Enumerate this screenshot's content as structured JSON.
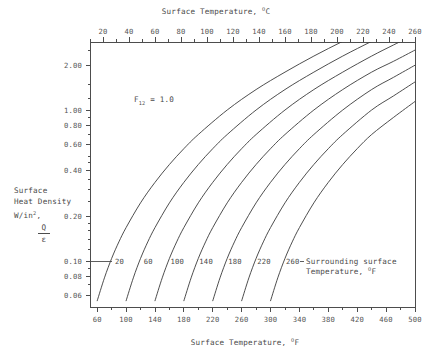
{
  "chart_data": {
    "type": "line",
    "title": "",
    "annotation": "F12 = 1.0",
    "annotation_base": "F",
    "annotation_sub": "12",
    "annotation_rest": " = 1.0",
    "top_axis": {
      "label_text": "Surface Temperature, ",
      "label_unit_sup": "O",
      "label_unit": "C",
      "ticks": [
        20,
        40,
        60,
        80,
        100,
        120,
        140,
        160,
        180,
        200,
        220,
        240,
        260
      ],
      "minor_step": 10,
      "range": [
        10,
        260
      ]
    },
    "bottom_axis": {
      "label_text": "Surface Temperature, ",
      "label_unit_sup": "O",
      "label_unit": "F",
      "ticks": [
        60,
        100,
        140,
        180,
        220,
        260,
        300,
        340,
        380,
        420,
        460,
        500
      ],
      "minor_step": 20,
      "range": [
        50,
        500
      ]
    },
    "y_axis": {
      "label_line1": "Surface",
      "label_line2": "Heat Density",
      "label_line3_base": "W/in",
      "label_line3_sup": "2",
      "label_line3_tail": ",",
      "label_frac_num": "Q",
      "label_frac_den": "ε",
      "scale": "log",
      "ticks": [
        2.0,
        1.0,
        0.8,
        0.6,
        0.4,
        0.2,
        0.1,
        0.08,
        0.06
      ],
      "tick_labels": [
        "2.00",
        "1.00",
        "0.80",
        "0.60",
        "0.40",
        "0.20",
        "0.10",
        "0.08",
        "0.06"
      ],
      "range": [
        0.05,
        2.85
      ]
    },
    "legend_annotation": {
      "line1": "Surrounding surface",
      "line2_text": "Temperature, ",
      "line2_sup": "O",
      "line2_unit": "F"
    },
    "series_label_row_value": 0.1,
    "series": [
      {
        "name": "20",
        "label": "20",
        "surrounding_temp_F": 20,
        "points": [
          [
            60,
            0.055
          ],
          [
            70,
            0.078
          ],
          [
            80,
            0.105
          ],
          [
            90,
            0.135
          ],
          [
            100,
            0.168
          ],
          [
            120,
            0.245
          ],
          [
            140,
            0.335
          ],
          [
            160,
            0.44
          ],
          [
            180,
            0.56
          ],
          [
            200,
            0.695
          ],
          [
            240,
            1.01
          ],
          [
            280,
            1.38
          ],
          [
            320,
            1.8
          ],
          [
            360,
            2.3
          ],
          [
            400,
            2.88
          ],
          [
            440,
            3.55
          ],
          [
            470,
            4.1
          ],
          [
            500,
            4.7
          ]
        ]
      },
      {
        "name": "60",
        "label": "60",
        "surrounding_temp_F": 60,
        "points": [
          [
            100,
            0.055
          ],
          [
            110,
            0.078
          ],
          [
            120,
            0.105
          ],
          [
            130,
            0.135
          ],
          [
            140,
            0.168
          ],
          [
            160,
            0.245
          ],
          [
            180,
            0.335
          ],
          [
            200,
            0.44
          ],
          [
            220,
            0.56
          ],
          [
            240,
            0.695
          ],
          [
            280,
            1.01
          ],
          [
            320,
            1.38
          ],
          [
            360,
            1.8
          ],
          [
            400,
            2.3
          ],
          [
            440,
            2.88
          ],
          [
            470,
            3.4
          ],
          [
            500,
            3.98
          ]
        ]
      },
      {
        "name": "100",
        "label": "100",
        "surrounding_temp_F": 100,
        "points": [
          [
            140,
            0.055
          ],
          [
            150,
            0.078
          ],
          [
            160,
            0.105
          ],
          [
            170,
            0.135
          ],
          [
            180,
            0.168
          ],
          [
            200,
            0.245
          ],
          [
            220,
            0.335
          ],
          [
            240,
            0.44
          ],
          [
            260,
            0.56
          ],
          [
            280,
            0.695
          ],
          [
            320,
            1.01
          ],
          [
            360,
            1.38
          ],
          [
            400,
            1.8
          ],
          [
            440,
            2.3
          ],
          [
            470,
            2.72
          ],
          [
            500,
            3.2
          ]
        ]
      },
      {
        "name": "140",
        "label": "140",
        "surrounding_temp_F": 140,
        "points": [
          [
            180,
            0.055
          ],
          [
            190,
            0.078
          ],
          [
            200,
            0.105
          ],
          [
            210,
            0.135
          ],
          [
            220,
            0.168
          ],
          [
            240,
            0.245
          ],
          [
            260,
            0.335
          ],
          [
            280,
            0.44
          ],
          [
            300,
            0.56
          ],
          [
            320,
            0.695
          ],
          [
            360,
            1.01
          ],
          [
            400,
            1.38
          ],
          [
            440,
            1.8
          ],
          [
            470,
            2.12
          ],
          [
            500,
            2.52
          ]
        ]
      },
      {
        "name": "180",
        "label": "180",
        "surrounding_temp_F": 180,
        "points": [
          [
            220,
            0.055
          ],
          [
            230,
            0.078
          ],
          [
            240,
            0.105
          ],
          [
            250,
            0.135
          ],
          [
            260,
            0.168
          ],
          [
            280,
            0.245
          ],
          [
            300,
            0.335
          ],
          [
            320,
            0.44
          ],
          [
            340,
            0.56
          ],
          [
            360,
            0.695
          ],
          [
            400,
            1.01
          ],
          [
            440,
            1.38
          ],
          [
            470,
            1.66
          ],
          [
            500,
            2.0
          ]
        ]
      },
      {
        "name": "220",
        "label": "220",
        "surrounding_temp_F": 220,
        "points": [
          [
            260,
            0.055
          ],
          [
            270,
            0.078
          ],
          [
            280,
            0.105
          ],
          [
            290,
            0.135
          ],
          [
            300,
            0.168
          ],
          [
            320,
            0.245
          ],
          [
            340,
            0.335
          ],
          [
            360,
            0.44
          ],
          [
            380,
            0.56
          ],
          [
            400,
            0.695
          ],
          [
            440,
            1.01
          ],
          [
            470,
            1.25
          ],
          [
            500,
            1.55
          ]
        ]
      },
      {
        "name": "260",
        "label": "260",
        "surrounding_temp_F": 260,
        "points": [
          [
            300,
            0.055
          ],
          [
            310,
            0.078
          ],
          [
            320,
            0.105
          ],
          [
            330,
            0.135
          ],
          [
            340,
            0.168
          ],
          [
            360,
            0.245
          ],
          [
            380,
            0.335
          ],
          [
            400,
            0.44
          ],
          [
            420,
            0.56
          ],
          [
            440,
            0.695
          ],
          [
            470,
            0.9
          ],
          [
            500,
            1.15
          ]
        ]
      }
    ]
  }
}
